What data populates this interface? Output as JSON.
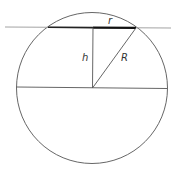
{
  "diagram": {
    "labels": {
      "r": "r",
      "h": "h",
      "R": "R"
    },
    "colors": {
      "stroke": "#555555",
      "thick": "#111111",
      "tangent": "#999999"
    }
  }
}
